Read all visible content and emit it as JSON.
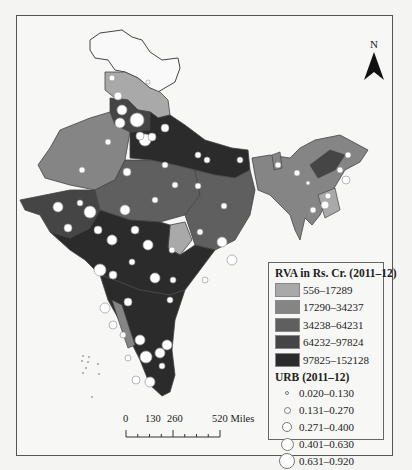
{
  "north_arrow": {
    "label": "N"
  },
  "legend": {
    "rva_title": "RVA in Rs. Cr. (2011–12)",
    "rva_classes": [
      {
        "label": "556–17289",
        "color": "#a9a9a9"
      },
      {
        "label": "17290–34237",
        "color": "#858585"
      },
      {
        "label": "34238–64231",
        "color": "#5f5f5f"
      },
      {
        "label": "64232–97824",
        "color": "#454545"
      },
      {
        "label": "97825–152128",
        "color": "#2b2b2b"
      }
    ],
    "urb_title": "URB (2011–12)",
    "urb_classes": [
      {
        "label": "0.020–0.130",
        "size": 4
      },
      {
        "label": "0.131–0.270",
        "size": 7
      },
      {
        "label": "0.271–0.400",
        "size": 10
      },
      {
        "label": "0.401–0.630",
        "size": 13
      },
      {
        "label": "0.631–0.920",
        "size": 17
      }
    ]
  },
  "scale_bar": {
    "ticks": [
      "0",
      "130",
      "260",
      "520 Miles"
    ]
  }
}
